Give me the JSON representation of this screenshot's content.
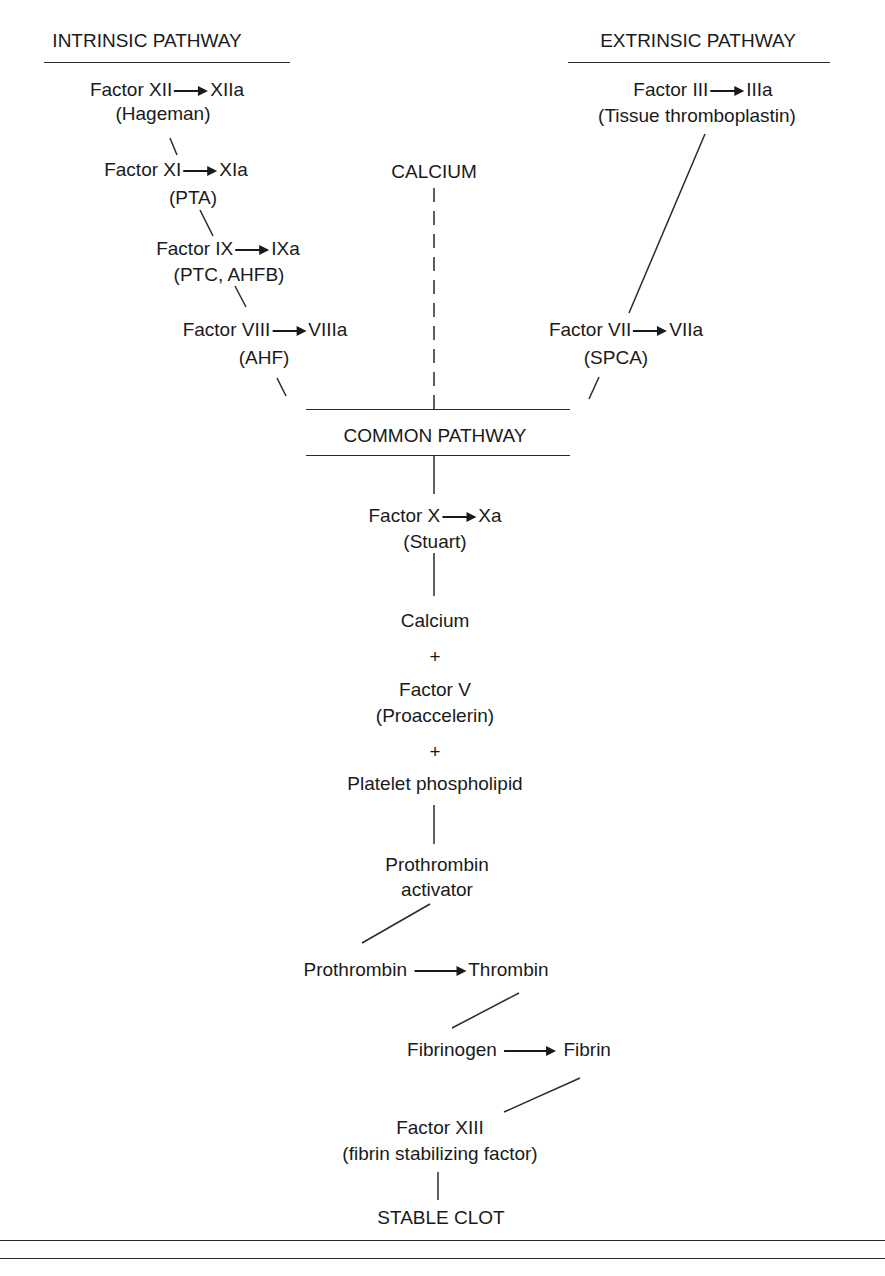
{
  "headers": {
    "intrinsic": "INTRINSIC PATHWAY",
    "extrinsic": "EXTRINSIC PATHWAY",
    "calcium": "CALCIUM",
    "common": "COMMON PATHWAY"
  },
  "intrinsic": [
    {
      "from": "Factor XII",
      "to": "XIIa",
      "alias": "(Hageman)"
    },
    {
      "from": "Factor XI",
      "to": "XIa",
      "alias": "(PTA)"
    },
    {
      "from": "Factor IX",
      "to": "IXa",
      "alias": "(PTC, AHFB)"
    },
    {
      "from": "Factor VIII",
      "to": "VIIIa",
      "alias": "(AHF)"
    }
  ],
  "extrinsic": [
    {
      "from": "Factor III",
      "to": "IIIa",
      "alias": "(Tissue thromboplastin)"
    },
    {
      "from": "Factor VII",
      "to": "VIIa",
      "alias": "(SPCA)"
    }
  ],
  "common": {
    "factor_x": {
      "from": "Factor X",
      "to": "Xa",
      "alias": "(Stuart)"
    },
    "calcium": "Calcium",
    "plus": "+",
    "factor_v": "Factor V",
    "factor_v_alias": "(Proaccelerin)",
    "platelet": "Platelet phospholipid",
    "activator_1": "Prothrombin",
    "activator_2": "activator",
    "prothrombin": "Prothrombin",
    "thrombin": "Thrombin",
    "fibrinogen": "Fibrinogen",
    "fibrin": "Fibrin",
    "factor_xiii": "Factor XIII",
    "factor_xiii_alias": "(fibrin stabilizing factor)",
    "stable_clot": "STABLE CLOT"
  }
}
